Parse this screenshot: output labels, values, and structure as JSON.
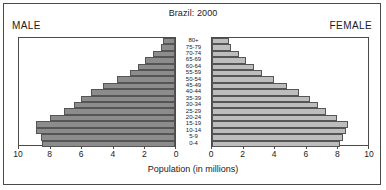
{
  "chart_data": {
    "type": "bar",
    "title": "Brazil: 2000",
    "xlabel": "Population (in millions)",
    "ylabel": "",
    "left_panel_label": "MALE",
    "right_panel_label": "FEMALE",
    "xlim": [
      0,
      10
    ],
    "xticks": [
      0,
      2,
      4,
      6,
      8,
      10
    ],
    "left_xticks_order": [
      10,
      8,
      6,
      4,
      2,
      0
    ],
    "right_xticks_order": [
      0,
      2,
      4,
      6,
      8,
      10
    ],
    "grid": false,
    "legend": "none",
    "categories": [
      "0-4",
      "5-9",
      "10-14",
      "15-19",
      "20-24",
      "25-29",
      "30-34",
      "35-39",
      "40-44",
      "45-49",
      "50-54",
      "55-59",
      "60-64",
      "65-69",
      "70-74",
      "75-79",
      "80+"
    ],
    "series": [
      {
        "name": "MALE",
        "color": "#8c8c8c",
        "side": "left",
        "values": [
          8.5,
          8.6,
          8.9,
          8.9,
          8.0,
          7.1,
          6.5,
          6.0,
          5.4,
          4.6,
          3.7,
          2.9,
          2.4,
          1.9,
          1.4,
          0.9,
          0.8
        ]
      },
      {
        "name": "FEMALE",
        "color": "#bdbdbd",
        "side": "right",
        "values": [
          8.2,
          8.4,
          8.6,
          8.7,
          8.0,
          7.3,
          6.8,
          6.3,
          5.6,
          4.8,
          4.0,
          3.2,
          2.7,
          2.2,
          1.7,
          1.2,
          1.1
        ]
      }
    ]
  },
  "axis": {
    "unit_label": "Population (in millions)"
  }
}
